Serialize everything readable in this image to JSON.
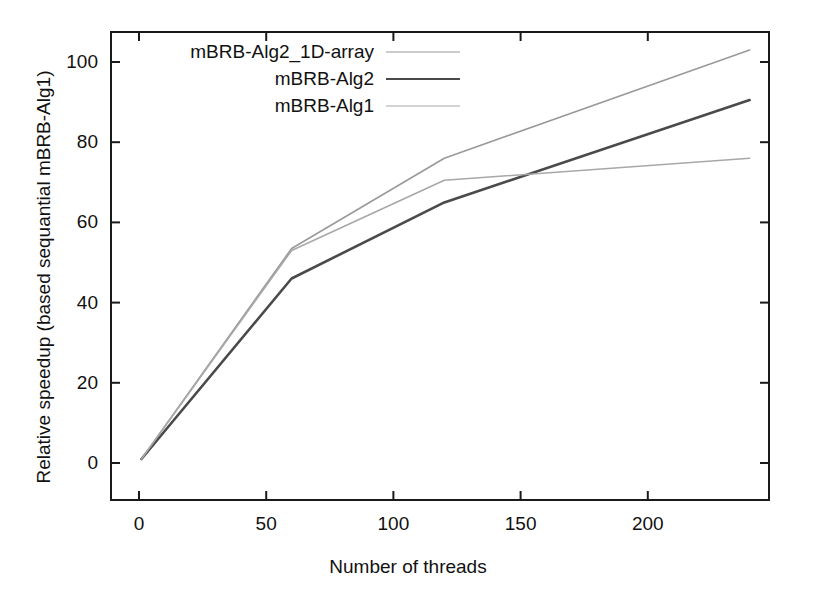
{
  "chart_data": {
    "type": "line",
    "title": "",
    "xlabel": "Number of threads",
    "ylabel": "Relative speedup (based sequantial mBRB-Alg1)",
    "xlim": [
      0,
      250
    ],
    "ylim": [
      0,
      110
    ],
    "xticks": [
      "0",
      "50",
      "100",
      "150",
      "200",
      "250"
    ],
    "xtick_values": [
      0,
      50,
      100,
      150,
      200,
      250
    ],
    "yticks": [
      "0",
      "20",
      "40",
      "60",
      "80",
      "100"
    ],
    "ytick_values": [
      0,
      20,
      40,
      60,
      80,
      100
    ],
    "grid": false,
    "legend_position": "top-left-inside",
    "x": [
      1,
      60,
      120,
      240
    ],
    "series": [
      {
        "name": "mBRB-Alg2_1D-array",
        "color": "#9a9a9a",
        "width": 1.6,
        "values": [
          1,
          53.5,
          76,
          103
        ]
      },
      {
        "name": "mBRB-Alg2",
        "color": "#4a4a4a",
        "width": 2.6,
        "values": [
          1,
          46,
          65,
          90.5
        ]
      },
      {
        "name": "mBRB-Alg1",
        "color": "#a8a8a8",
        "width": 1.6,
        "values": [
          1,
          53,
          70.5,
          76
        ]
      }
    ]
  },
  "legend": {
    "entries": [
      {
        "label": "mBRB-Alg2_1D-array",
        "key": "line-sample-1d-array"
      },
      {
        "label": "mBRB-Alg2",
        "key": "line-sample-alg2"
      },
      {
        "label": "mBRB-Alg1",
        "key": "line-sample-alg1"
      }
    ]
  },
  "axes": {
    "x_title": "Number of threads",
    "y_title": "Relative speedup (based sequantial mBRB-Alg1)",
    "x_labels": [
      "0",
      "50",
      "100",
      "150",
      "200",
      "250"
    ],
    "y_labels": [
      "0",
      "20",
      "40",
      "60",
      "80",
      "100"
    ]
  }
}
